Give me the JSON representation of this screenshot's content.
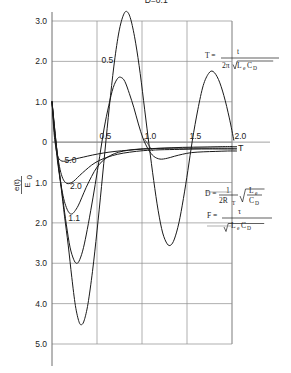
{
  "chart_data": {
    "type": "line",
    "title": "",
    "xlabel": "T",
    "ylabel": "e(t)/E0",
    "xlim": [
      0,
      2.1
    ],
    "ylim": [
      -5.3,
      3.6
    ],
    "grid": true,
    "xticks": [
      "0.5",
      "1.0",
      "1.5",
      "2.0"
    ],
    "xtick_values": [
      0.5,
      1.0,
      1.5,
      2.0
    ],
    "yticks": [
      "3.0",
      "2.0",
      "1.0",
      "0",
      "1.0",
      "2.0",
      "3.0",
      "4.0",
      "5.0"
    ],
    "ytick_values": [
      3.0,
      2.0,
      1.0,
      0,
      -1.0,
      -2.0,
      -3.0,
      -4.0,
      -5.0
    ],
    "legend_position": "inline-curve-labels",
    "series": [
      {
        "name": "D=0.1",
        "label": "D=0.1",
        "label_x": 1.03,
        "label_y": 3.45,
        "damping": 0.1,
        "points": [
          [
            0.0,
            1.0
          ],
          [
            0.03,
            0.2
          ],
          [
            0.06,
            -0.45
          ],
          [
            0.1,
            -1.1
          ],
          [
            0.14,
            -1.85
          ],
          [
            0.18,
            -2.55
          ],
          [
            0.22,
            -3.35
          ],
          [
            0.26,
            -4.05
          ],
          [
            0.3,
            -4.45
          ],
          [
            0.33,
            -4.52
          ],
          [
            0.36,
            -4.4
          ],
          [
            0.4,
            -4.0
          ],
          [
            0.45,
            -3.2
          ],
          [
            0.5,
            -2.2
          ],
          [
            0.55,
            -1.1
          ],
          [
            0.6,
            0.05
          ],
          [
            0.65,
            1.15
          ],
          [
            0.7,
            2.1
          ],
          [
            0.75,
            2.8
          ],
          [
            0.8,
            3.18
          ],
          [
            0.84,
            3.22
          ],
          [
            0.88,
            3.0
          ],
          [
            0.93,
            2.45
          ],
          [
            0.98,
            1.7
          ],
          [
            1.03,
            0.8
          ],
          [
            1.08,
            -0.1
          ],
          [
            1.13,
            -0.95
          ],
          [
            1.18,
            -1.7
          ],
          [
            1.23,
            -2.25
          ],
          [
            1.28,
            -2.52
          ],
          [
            1.32,
            -2.55
          ],
          [
            1.36,
            -2.4
          ],
          [
            1.41,
            -2.0
          ],
          [
            1.46,
            -1.4
          ],
          [
            1.51,
            -0.7
          ],
          [
            1.56,
            0.05
          ],
          [
            1.62,
            0.8
          ],
          [
            1.68,
            1.4
          ],
          [
            1.74,
            1.7
          ],
          [
            1.79,
            1.75
          ],
          [
            1.85,
            1.55
          ],
          [
            1.91,
            1.15
          ],
          [
            1.97,
            0.6
          ],
          [
            2.02,
            0.05
          ]
        ]
      },
      {
        "name": "0.5",
        "label": "0.5",
        "label_x": 0.55,
        "label_y": 1.95,
        "damping": 0.5,
        "points": [
          [
            0.0,
            1.0
          ],
          [
            0.04,
            0.1
          ],
          [
            0.08,
            -0.7
          ],
          [
            0.12,
            -1.4
          ],
          [
            0.16,
            -2.05
          ],
          [
            0.2,
            -2.6
          ],
          [
            0.24,
            -2.9
          ],
          [
            0.27,
            -3.0
          ],
          [
            0.3,
            -2.95
          ],
          [
            0.34,
            -2.7
          ],
          [
            0.38,
            -2.3
          ],
          [
            0.43,
            -1.7
          ],
          [
            0.48,
            -1.05
          ],
          [
            0.53,
            -0.35
          ],
          [
            0.58,
            0.35
          ],
          [
            0.63,
            0.9
          ],
          [
            0.68,
            1.35
          ],
          [
            0.73,
            1.58
          ],
          [
            0.77,
            1.6
          ],
          [
            0.81,
            1.5
          ],
          [
            0.86,
            1.2
          ],
          [
            0.91,
            0.85
          ],
          [
            0.96,
            0.45
          ],
          [
            1.01,
            0.1
          ],
          [
            1.07,
            -0.18
          ],
          [
            1.13,
            -0.35
          ],
          [
            1.2,
            -0.42
          ],
          [
            1.28,
            -0.4
          ],
          [
            1.36,
            -0.35
          ],
          [
            1.45,
            -0.3
          ],
          [
            1.55,
            -0.26
          ],
          [
            1.68,
            -0.24
          ],
          [
            1.82,
            -0.23
          ],
          [
            1.95,
            -0.22
          ],
          [
            2.05,
            -0.22
          ]
        ]
      },
      {
        "name": "1.1",
        "label": "1.1",
        "label_x": 0.18,
        "label_y": -1.95,
        "damping": 1.1,
        "points": [
          [
            0.0,
            1.0
          ],
          [
            0.04,
            0.1
          ],
          [
            0.07,
            -0.55
          ],
          [
            0.1,
            -1.05
          ],
          [
            0.13,
            -1.4
          ],
          [
            0.16,
            -1.62
          ],
          [
            0.19,
            -1.75
          ],
          [
            0.22,
            -1.78
          ],
          [
            0.25,
            -1.72
          ],
          [
            0.29,
            -1.58
          ],
          [
            0.33,
            -1.38
          ],
          [
            0.38,
            -1.12
          ],
          [
            0.44,
            -0.85
          ],
          [
            0.5,
            -0.62
          ],
          [
            0.57,
            -0.45
          ],
          [
            0.65,
            -0.33
          ],
          [
            0.74,
            -0.25
          ],
          [
            0.85,
            -0.2
          ],
          [
            0.98,
            -0.17
          ],
          [
            1.12,
            -0.16
          ],
          [
            1.3,
            -0.15
          ],
          [
            1.52,
            -0.15
          ],
          [
            1.75,
            -0.15
          ],
          [
            2.0,
            -0.15
          ],
          [
            2.05,
            -0.15
          ]
        ]
      },
      {
        "name": "2.0",
        "label": "2.0",
        "label_x": 0.2,
        "label_y": -1.17,
        "damping": 2.0,
        "points": [
          [
            0.0,
            1.0
          ],
          [
            0.03,
            0.25
          ],
          [
            0.06,
            -0.3
          ],
          [
            0.09,
            -0.68
          ],
          [
            0.12,
            -0.9
          ],
          [
            0.15,
            -1.0
          ],
          [
            0.18,
            -1.03
          ],
          [
            0.22,
            -1.0
          ],
          [
            0.26,
            -0.93
          ],
          [
            0.31,
            -0.82
          ],
          [
            0.37,
            -0.7
          ],
          [
            0.44,
            -0.57
          ],
          [
            0.52,
            -0.46
          ],
          [
            0.62,
            -0.37
          ],
          [
            0.73,
            -0.3
          ],
          [
            0.86,
            -0.25
          ],
          [
            1.02,
            -0.21
          ],
          [
            1.2,
            -0.19
          ],
          [
            1.42,
            -0.18
          ],
          [
            1.66,
            -0.17
          ],
          [
            1.9,
            -0.17
          ],
          [
            2.05,
            -0.17
          ]
        ]
      },
      {
        "name": "5.0",
        "label": "5.0",
        "label_x": 0.14,
        "label_y": -0.52,
        "damping": 5.0,
        "points": [
          [
            0.0,
            1.0
          ],
          [
            0.02,
            0.3
          ],
          [
            0.04,
            -0.1
          ],
          [
            0.06,
            -0.32
          ],
          [
            0.08,
            -0.42
          ],
          [
            0.11,
            -0.47
          ],
          [
            0.15,
            -0.47
          ],
          [
            0.2,
            -0.45
          ],
          [
            0.27,
            -0.41
          ],
          [
            0.35,
            -0.37
          ],
          [
            0.45,
            -0.32
          ],
          [
            0.57,
            -0.27
          ],
          [
            0.7,
            -0.23
          ],
          [
            0.85,
            -0.2
          ],
          [
            1.02,
            -0.17
          ],
          [
            1.22,
            -0.15
          ],
          [
            1.45,
            -0.13
          ],
          [
            1.7,
            -0.12
          ],
          [
            1.95,
            -0.11
          ],
          [
            2.05,
            -0.11
          ]
        ]
      }
    ],
    "annotations": [
      {
        "name": "formula-T",
        "lhs": "T =",
        "numerator": "t",
        "denominator_prefix": "2π",
        "denominator_radical": "L",
        "denominator_sub1": "e",
        "denominator_radical2": "C",
        "denominator_sub2": "D"
      },
      {
        "name": "formula-D",
        "lhs": "D =",
        "frac_num": "1",
        "frac_den": "2R",
        "frac_den_sub": "T",
        "rad_num": "L",
        "rad_num_sub": "e",
        "rad_den": "C",
        "rad_den_sub": "D"
      },
      {
        "name": "formula-F",
        "lhs": "F =",
        "numerator": "τ",
        "denominator_radical": "L",
        "denominator_sub1": "e",
        "denominator_radical2": "C",
        "denominator_sub2": "D"
      }
    ]
  },
  "axis": {
    "x_letter": "T",
    "y_label_numerator": "e(t)",
    "y_label_denominator": "E",
    "y_label_denominator_sub": "0"
  },
  "colors": {
    "curve": "#1a1a1a",
    "grid": "#8c8c8c",
    "axis": "#6f6f6f",
    "text": "#1a1a1a",
    "background": "#ffffff"
  }
}
